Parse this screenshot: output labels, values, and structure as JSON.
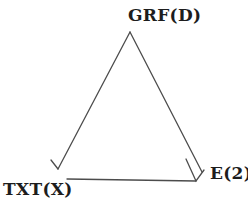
{
  "figure": {
    "type": "triangle-diagram",
    "background_color": "#ffffff",
    "line_color": "#4c4c4c",
    "text_color": "#1d1d1d",
    "nodes": [
      {
        "id": "grf",
        "label": "GRF(D)",
        "position": "top"
      },
      {
        "id": "txt",
        "label": "TXT(X)",
        "position": "bottom-left"
      },
      {
        "id": "e",
        "label": "E(2)",
        "position": "bottom-right"
      }
    ],
    "edges": [
      {
        "from": "GRF(D)",
        "to": "TXT(X)",
        "arrowhead": "open arrowhead at TXT(X) end"
      },
      {
        "from": "GRF(D)",
        "to": "E(2)",
        "arrowhead": "open V arrowhead at E(2) end"
      },
      {
        "from": "TXT(X)",
        "to": "E(2)",
        "arrowhead": "merges into V arrowhead at E(2) corner"
      }
    ]
  }
}
